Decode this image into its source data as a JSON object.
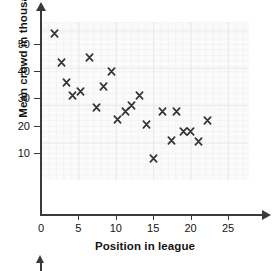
{
  "chart_data": {
    "type": "scatter",
    "title": "",
    "xlabel": "Position in league",
    "ylabel": "Mean crowd in thousands",
    "xlim": [
      0,
      27
    ],
    "ylim": [
      0,
      57
    ],
    "xticks": [
      0,
      5,
      10,
      15,
      20,
      25
    ],
    "xtick_labels": [
      "0",
      "5",
      "10",
      "15",
      "20",
      "25"
    ],
    "yticks": [
      10,
      20,
      30,
      40,
      50
    ],
    "ytick_labels": [
      "10",
      "20",
      "30",
      "40",
      "50"
    ],
    "grid": true,
    "grid_minor": true,
    "marker": "x",
    "marker_color": "#333333",
    "legend": null,
    "series": [
      {
        "name": "teams",
        "points": [
          {
            "x": 1.8,
            "y": 54.0
          },
          {
            "x": 2.8,
            "y": 43.2
          },
          {
            "x": 3.4,
            "y": 36.0
          },
          {
            "x": 4.2,
            "y": 31.2
          },
          {
            "x": 5.3,
            "y": 32.4
          },
          {
            "x": 6.5,
            "y": 45.2
          },
          {
            "x": 7.4,
            "y": 26.5
          },
          {
            "x": 8.3,
            "y": 34.3
          },
          {
            "x": 9.4,
            "y": 40.0
          },
          {
            "x": 10.2,
            "y": 22.2
          },
          {
            "x": 11.3,
            "y": 25.3
          },
          {
            "x": 12.1,
            "y": 27.3
          },
          {
            "x": 13.2,
            "y": 31.0
          },
          {
            "x": 14.1,
            "y": 20.5
          },
          {
            "x": 15.1,
            "y": 8.0
          },
          {
            "x": 16.2,
            "y": 25.2
          },
          {
            "x": 17.4,
            "y": 14.7
          },
          {
            "x": 18.1,
            "y": 25.1
          },
          {
            "x": 19.1,
            "y": 18.0
          },
          {
            "x": 20.0,
            "y": 18.0
          },
          {
            "x": 21.1,
            "y": 14.2
          },
          {
            "x": 22.2,
            "y": 21.9
          }
        ]
      }
    ]
  },
  "figure": {
    "x_axis_title": "Position in league",
    "y_axis_title": "Mean crowd in thousands"
  }
}
